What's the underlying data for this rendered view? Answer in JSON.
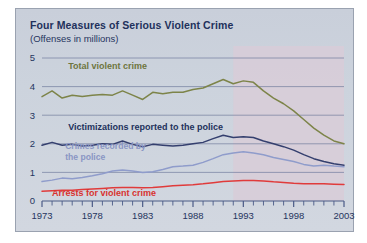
{
  "figure": {
    "title": "Four Measures of Serious Violent Crime",
    "subtitle": "(Offenses in millions)",
    "panel_bg": "#ccd2dc",
    "title_color": "#22315c"
  },
  "chart_data": {
    "type": "line",
    "title": "Four Measures of Serious Violent Crime",
    "subtitle": "(Offenses in millions)",
    "xlabel": "",
    "ylabel": "Offenses in millions",
    "xlim": [
      1973,
      2003
    ],
    "ylim": [
      0,
      5
    ],
    "yticks": [
      "0",
      "1",
      "2",
      "3",
      "4",
      "5"
    ],
    "ytick_values": [
      0,
      1,
      2,
      3,
      4,
      5
    ],
    "xticks": [
      "1973",
      "1978",
      "1983",
      "1988",
      "1993",
      "1998",
      "2003"
    ],
    "xtick_values": [
      1973,
      1978,
      1983,
      1988,
      1993,
      1998,
      2003
    ],
    "minor_xticks_every": 1,
    "grid": "horizontal",
    "legend_position": "inline-annotations",
    "shaded_region": {
      "label": "",
      "x_start": 1992,
      "x_end": 2003,
      "color": "#d8ccd8"
    },
    "x": [
      1973,
      1974,
      1975,
      1976,
      1977,
      1978,
      1979,
      1980,
      1981,
      1982,
      1983,
      1984,
      1985,
      1986,
      1987,
      1988,
      1989,
      1990,
      1991,
      1992,
      1993,
      1994,
      1995,
      1996,
      1997,
      1998,
      1999,
      2000,
      2001,
      2002,
      2003
    ],
    "series": [
      {
        "name": "Total violent crime",
        "color": "#7d8449",
        "label_color": "#6e7540",
        "values": [
          3.65,
          3.85,
          3.6,
          3.7,
          3.65,
          3.7,
          3.72,
          3.7,
          3.85,
          3.7,
          3.55,
          3.8,
          3.75,
          3.8,
          3.8,
          3.9,
          3.95,
          4.1,
          4.25,
          4.1,
          4.2,
          4.15,
          3.85,
          3.6,
          3.4,
          3.15,
          2.85,
          2.55,
          2.3,
          2.1,
          2.0
        ],
        "label_x": 1975.6,
        "label_y": 4.62
      },
      {
        "name": "Victimizations reported to the police",
        "color": "#343f6e",
        "label_color": "#22315c",
        "values": [
          1.95,
          2.05,
          1.95,
          1.98,
          1.92,
          1.95,
          2.0,
          1.98,
          2.1,
          1.98,
          1.9,
          1.98,
          1.95,
          1.92,
          1.95,
          2.0,
          2.05,
          2.18,
          2.3,
          2.22,
          2.25,
          2.22,
          2.1,
          2.0,
          1.9,
          1.78,
          1.62,
          1.48,
          1.38,
          1.3,
          1.25
        ],
        "label_x": 1975.6,
        "label_y": 2.48
      },
      {
        "name": "Crimes recorded by the police",
        "color": "#8f9ccb",
        "label_color": "#8a96c4",
        "values": [
          0.68,
          0.73,
          0.8,
          0.78,
          0.82,
          0.88,
          0.95,
          1.05,
          1.08,
          1.05,
          1.0,
          1.02,
          1.1,
          1.2,
          1.22,
          1.25,
          1.35,
          1.48,
          1.62,
          1.68,
          1.72,
          1.68,
          1.62,
          1.52,
          1.45,
          1.38,
          1.28,
          1.22,
          1.25,
          1.22,
          1.2
        ],
        "label_line1": "Crimes recorded by",
        "label_line2": "the police",
        "label_x": 1975.3,
        "label_y": 1.82
      },
      {
        "name": "Arrests for violent crime",
        "color": "#e03b3b",
        "label_color": "#d8322f",
        "values": [
          0.34,
          0.36,
          0.38,
          0.38,
          0.4,
          0.42,
          0.44,
          0.46,
          0.47,
          0.47,
          0.46,
          0.47,
          0.5,
          0.53,
          0.55,
          0.57,
          0.6,
          0.64,
          0.68,
          0.7,
          0.72,
          0.72,
          0.7,
          0.67,
          0.65,
          0.62,
          0.6,
          0.6,
          0.6,
          0.59,
          0.58
        ],
        "label_x": 1974.0,
        "label_y": 0.18
      }
    ]
  }
}
